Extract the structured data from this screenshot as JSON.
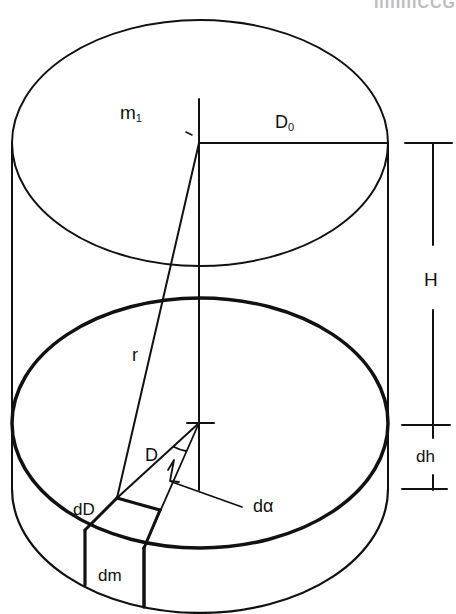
{
  "figure": {
    "header_fragment": "IIIIIIIICCG",
    "colors": {
      "stroke": "#111111",
      "background": "#ffffff"
    }
  },
  "labels": {
    "m1": {
      "main": "m",
      "sub": "1"
    },
    "D0": {
      "main": "D",
      "sub": "0"
    },
    "H": "H",
    "r": "r",
    "D": "D",
    "dh": "dh",
    "dalpha": "dα",
    "dD": "dD",
    "dm": "dm",
    "angle_marker": "1"
  }
}
